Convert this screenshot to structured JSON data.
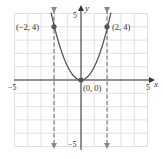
{
  "chart_data": {
    "type": "line",
    "title": "",
    "xlabel": "x",
    "ylabel": "y",
    "xlim": [
      -5,
      5
    ],
    "ylim": [
      -5,
      5
    ],
    "grid": true,
    "x_tick_labels": [
      "-5",
      "5"
    ],
    "y_tick_labels": [
      "5",
      "-5"
    ],
    "series": [
      {
        "name": "y = x^2",
        "kind": "curve",
        "x": [
          -2.2,
          -2,
          -1.5,
          -1,
          -0.5,
          0,
          0.5,
          1,
          1.5,
          2,
          2.2
        ],
        "y": [
          4.84,
          4,
          2.25,
          1,
          0.25,
          0,
          0.25,
          1,
          2.25,
          4,
          4.84
        ]
      }
    ],
    "points": [
      {
        "x": -2,
        "y": 4,
        "label": "(−2, 4)"
      },
      {
        "x": 0,
        "y": 0,
        "label": "(0, 0)"
      },
      {
        "x": 2,
        "y": 4,
        "label": "(2, 4)"
      }
    ],
    "dashed_vertical_lines": [
      {
        "x": -2,
        "arrows": "both"
      },
      {
        "x": 2,
        "arrows": "both"
      }
    ],
    "colors": {
      "grid": "#d9d9d9",
      "axis": "#333333",
      "curve": "#555555",
      "dashed": "#888888",
      "point": "#555555",
      "text": "#333333"
    }
  },
  "labels": {
    "x_axis": "x",
    "y_axis": "y",
    "x_min": "−5",
    "x_max": "5",
    "y_max": "5",
    "y_min": "−5",
    "pt_left": "(−2, 4)",
    "pt_origin": "(0, 0)",
    "pt_right": "(2, 4)"
  }
}
